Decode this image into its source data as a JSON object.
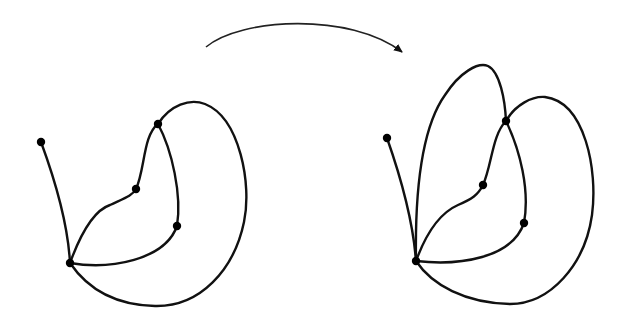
{
  "diagram": {
    "colors": {
      "stroke": "#111111",
      "vertex": "#000000",
      "background": "#ffffff"
    },
    "arrow": {
      "from": [
        206,
        47
      ],
      "to": [
        402,
        52
      ],
      "direction": "left-to-right"
    },
    "graphs": [
      {
        "id": "before",
        "vertices": [
          {
            "id": "isolated-leaf",
            "x": 41,
            "y": 142
          },
          {
            "id": "top",
            "x": 158,
            "y": 124
          },
          {
            "id": "middle",
            "x": 136,
            "y": 189
          },
          {
            "id": "right",
            "x": 177,
            "y": 226
          },
          {
            "id": "bottom",
            "x": 70,
            "y": 263
          }
        ],
        "edge_count": 6
      },
      {
        "id": "after",
        "vertices": [
          {
            "id": "isolated-leaf",
            "x": 387,
            "y": 138
          },
          {
            "id": "top",
            "x": 506,
            "y": 121
          },
          {
            "id": "middle",
            "x": 483,
            "y": 185
          },
          {
            "id": "right",
            "x": 524,
            "y": 223
          },
          {
            "id": "bottom",
            "x": 416,
            "y": 261
          }
        ],
        "edge_count": 7
      }
    ]
  }
}
